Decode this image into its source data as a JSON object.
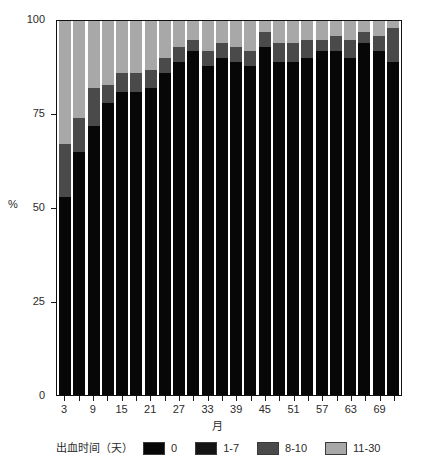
{
  "chart_data": {
    "type": "bar",
    "stacked": true,
    "stack_mode": "percent",
    "title": "",
    "subtitle": "",
    "xlabel": "月",
    "ylabel": "%",
    "ylim": [
      0,
      100
    ],
    "yticks": [
      0,
      25,
      50,
      75,
      100
    ],
    "ytick_labels": [
      "0",
      "25",
      "50",
      "75",
      "100"
    ],
    "grid": false,
    "legend_position": "bottom",
    "legend_title": "出血时间（天）",
    "categories": [
      3,
      6,
      9,
      12,
      15,
      18,
      21,
      24,
      27,
      30,
      33,
      36,
      39,
      42,
      45,
      48,
      51,
      54,
      57,
      60,
      63,
      66,
      69,
      72
    ],
    "xtick_labels": [
      "3",
      "9",
      "15",
      "21",
      "27",
      "33",
      "39",
      "45",
      "51",
      "57",
      "63",
      "69"
    ],
    "xtick_categories": [
      3,
      9,
      15,
      21,
      27,
      33,
      39,
      45,
      51,
      57,
      63,
      69
    ],
    "series": [
      {
        "name": "0",
        "color": "#070707",
        "values": [
          53,
          65,
          72,
          78,
          81,
          81,
          82,
          86,
          89,
          92,
          88,
          90,
          89,
          88,
          93,
          89,
          89,
          90,
          92,
          92,
          90,
          94,
          92,
          89
        ]
      },
      {
        "name": "1-7",
        "color": "#141414",
        "values": [
          0,
          0,
          0,
          0,
          0,
          0,
          0,
          0,
          0,
          0,
          0,
          0,
          0,
          0,
          0,
          0,
          0,
          0,
          0,
          0,
          0,
          0,
          0,
          0
        ]
      },
      {
        "name": "8-10",
        "color": "#4a4a4a",
        "values": [
          14,
          9,
          10,
          5,
          5,
          5,
          5,
          4,
          4,
          3,
          4,
          4,
          4,
          4,
          4,
          5,
          5,
          5,
          3,
          4,
          5,
          3,
          4,
          9
        ]
      },
      {
        "name": "11-30",
        "color": "#a8a8a8",
        "values": [
          33,
          26,
          18,
          17,
          14,
          14,
          13,
          10,
          7,
          5,
          8,
          6,
          7,
          8,
          3,
          6,
          6,
          5,
          5,
          4,
          5,
          3,
          4,
          2
        ]
      }
    ]
  },
  "axes": {
    "y_title": "%",
    "x_title": "月"
  },
  "legend": {
    "title": "出血时间（天）",
    "items": [
      {
        "label": "0",
        "color": "#070707"
      },
      {
        "label": "1-7",
        "color": "#141414"
      },
      {
        "label": "8-10",
        "color": "#4a4a4a"
      },
      {
        "label": "11-30",
        "color": "#a8a8a8"
      }
    ]
  }
}
